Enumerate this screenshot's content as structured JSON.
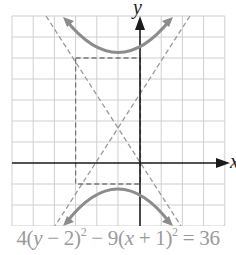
{
  "figure": {
    "axes": {
      "x_label": "x",
      "y_label": "y",
      "x_range": [
        -6,
        4
      ],
      "y_range": [
        -3,
        7
      ],
      "grid_step": 1
    },
    "equation": {
      "parts": [
        "4(",
        "y",
        " − 2)",
        "2",
        " − 9(",
        "x",
        " + 1)",
        "2",
        " = 36"
      ]
    },
    "hyperbola": {
      "center": [
        -1,
        2
      ],
      "a": 3,
      "b": 2,
      "orientation": "vertical"
    },
    "colors": {
      "curve": "#8c8c8c",
      "grid": "#c8c8c8",
      "axis": "#1a1a1a",
      "dashed": "#9a9a9a"
    }
  }
}
